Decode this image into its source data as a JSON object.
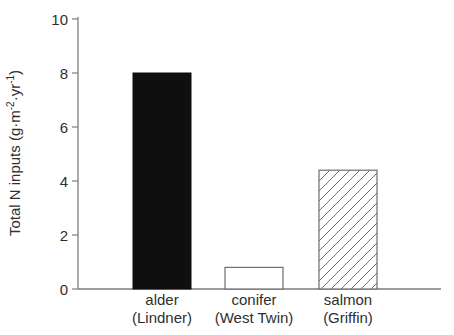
{
  "figure": {
    "background": "#ffffff"
  },
  "colors": {
    "axis": "#7d7d7d",
    "text": "#2f2f2f",
    "solid_bar": "#0f0f0f",
    "bar_outline": "#6e6e6e",
    "hatch_line": "#6e6e6e"
  },
  "chart_data": {
    "type": "bar",
    "title": "",
    "xlabel": "",
    "ylabel": "Total N inputs (g·m⁻²·yr⁻¹)",
    "ylabel_parts": [
      {
        "text": "Total N inputs (g·m",
        "sup": false
      },
      {
        "text": "-2",
        "sup": true
      },
      {
        "text": "·yr",
        "sup": false
      },
      {
        "text": "-1",
        "sup": true
      },
      {
        "text": ")",
        "sup": false
      }
    ],
    "ylim": [
      0,
      10
    ],
    "yticks": [
      0,
      2,
      4,
      6,
      8,
      10
    ],
    "grid": false,
    "legend": null,
    "categories": [
      {
        "name": "alder",
        "lines": [
          "alder",
          "(Lindner)"
        ]
      },
      {
        "name": "conifer",
        "lines": [
          "conifer",
          "(West Twin)"
        ]
      },
      {
        "name": "salmon",
        "lines": [
          "salmon",
          "(Griffin)"
        ]
      }
    ],
    "values": [
      8.0,
      0.8,
      4.4
    ],
    "bar_styles": [
      "solid-black",
      "white-open",
      "diagonal-hatch"
    ]
  }
}
